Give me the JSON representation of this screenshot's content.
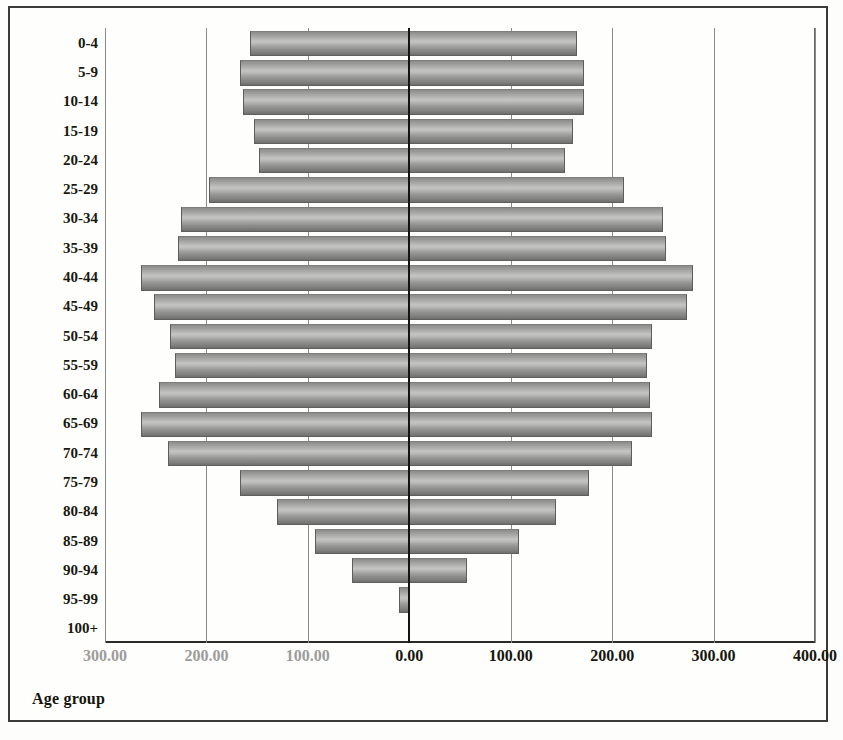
{
  "chart_data": {
    "type": "bar",
    "subtype": "population-pyramid",
    "title": "",
    "xlabel": "",
    "ylabel": "Age group",
    "axis_title": "Age group",
    "orientation": "horizontal",
    "grid": true,
    "legend": false,
    "categories": [
      "0-4",
      "5-9",
      "10-14",
      "15-19",
      "20-24",
      "25-29",
      "30-34",
      "35-39",
      "40-44",
      "45-49",
      "50-54",
      "55-59",
      "60-64",
      "65-69",
      "70-74",
      "75-79",
      "80-84",
      "85-89",
      "90-94",
      "95-99",
      "100+"
    ],
    "xlim": [
      -300,
      400
    ],
    "xticks": [
      -300,
      -200,
      -100,
      0,
      100,
      200,
      300,
      400
    ],
    "xticklabels": [
      "300.00",
      "200.00",
      "100.00",
      "0.00",
      "100.00",
      "200.00",
      "300.00",
      "400.00"
    ],
    "series": [
      {
        "name": "Male",
        "side": "left",
        "values": [
          157,
          167,
          164,
          153,
          148,
          197,
          225,
          228,
          265,
          252,
          236,
          231,
          247,
          265,
          238,
          167,
          130,
          93,
          56,
          10,
          0
        ]
      },
      {
        "name": "Female",
        "side": "right",
        "values": [
          164,
          171,
          171,
          160,
          153,
          211,
          249,
          252,
          279,
          273,
          238,
          233,
          236,
          238,
          219,
          176,
          144,
          107,
          56,
          0,
          0
        ]
      }
    ]
  },
  "axis": {
    "title": "Age group"
  }
}
